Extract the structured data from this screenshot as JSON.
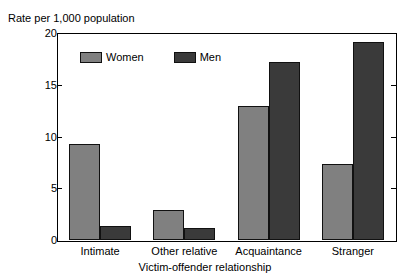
{
  "chart_data": {
    "type": "bar",
    "title": "",
    "ylabel": "Rate per 1,000 population",
    "xlabel": "Victim-offender relationship",
    "categories": [
      "Intimate",
      "Other relative",
      "Acquaintance",
      "Stranger"
    ],
    "series": [
      {
        "name": "Women",
        "color": "#808080",
        "values": [
          9.3,
          2.9,
          13.0,
          7.4
        ]
      },
      {
        "name": "Men",
        "color": "#3a3a3a",
        "values": [
          1.4,
          1.2,
          17.3,
          19.2
        ]
      }
    ],
    "ylim": [
      0,
      20
    ],
    "yticks": [
      0,
      5,
      10,
      15,
      20
    ],
    "ytick_labels": [
      "0",
      "5",
      "10",
      "15",
      "20"
    ],
    "grid": false,
    "legend_position": "inside-top-left"
  },
  "legend": {
    "items": [
      {
        "label": "Women",
        "swatch": "women-swatch"
      },
      {
        "label": "Men",
        "swatch": "men-swatch"
      }
    ]
  }
}
